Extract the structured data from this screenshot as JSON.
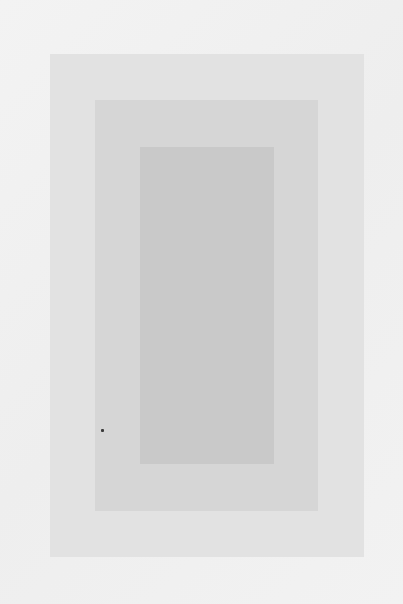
{
  "artwork": {
    "description": "Three nested grey rectangles on a light grey background",
    "background_color": "#f1f1f1",
    "rectangles": [
      {
        "name": "outer",
        "x": 50,
        "y": 54,
        "width": 314,
        "height": 503,
        "color": "#e2e2e2"
      },
      {
        "name": "middle",
        "x": 95,
        "y": 100,
        "width": 223,
        "height": 411,
        "color": "#d6d6d6"
      },
      {
        "name": "inner",
        "x": 140,
        "y": 147,
        "width": 134,
        "height": 317,
        "color": "#c9c9c9"
      }
    ],
    "speck": {
      "x": 102,
      "y": 430,
      "color": "#3a3a3a"
    }
  }
}
